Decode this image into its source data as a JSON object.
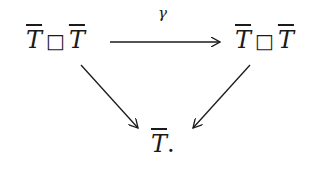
{
  "diagram": {
    "type": "commutative-triangle",
    "nodes": {
      "top_left": {
        "left": "T",
        "op": "□",
        "right": "T"
      },
      "top_right": {
        "left": "T",
        "op": "□",
        "right": "T"
      },
      "bottom": {
        "symbol": "T",
        "suffix": "."
      }
    },
    "arrows": [
      {
        "from": "top_left",
        "to": "top_right",
        "label": "γ"
      },
      {
        "from": "top_left",
        "to": "bottom",
        "label": ""
      },
      {
        "from": "top_right",
        "to": "bottom",
        "label": ""
      }
    ],
    "colors": {
      "ink": "#1a1a1a",
      "background": "#ffffff"
    }
  }
}
